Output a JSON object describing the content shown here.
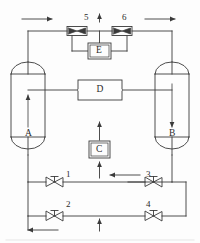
{
  "diagram": {
    "type": "process-flow-diagram",
    "line_color": "#3a3a3a",
    "background_color": "#fdfdfd",
    "equipment": [
      {
        "id": "A",
        "label": "A",
        "shape": "vertical-vessel",
        "flow_arrow": "up"
      },
      {
        "id": "B",
        "label": "B",
        "shape": "vertical-vessel",
        "flow_arrow": "down"
      },
      {
        "id": "C",
        "label": "C",
        "shape": "double-border-box",
        "flow_arrow": "up"
      },
      {
        "id": "D",
        "label": "D",
        "shape": "rectangle-box"
      },
      {
        "id": "E",
        "label": "E",
        "shape": "double-border-box"
      }
    ],
    "valves": [
      {
        "id": "1",
        "label": "1",
        "style": "gate-valve",
        "orientation": "horizontal"
      },
      {
        "id": "2",
        "label": "2",
        "style": "gate-valve",
        "orientation": "horizontal"
      },
      {
        "id": "3",
        "label": "3",
        "style": "gate-valve",
        "orientation": "horizontal"
      },
      {
        "id": "4",
        "label": "4",
        "style": "gate-valve",
        "orientation": "horizontal"
      },
      {
        "id": "5",
        "label": "5",
        "style": "inline-valve-box",
        "orientation": "horizontal"
      },
      {
        "id": "6",
        "label": "6",
        "style": "inline-valve-box",
        "orientation": "horizontal"
      }
    ],
    "flow_arrows": [
      {
        "name": "top-left-inlet",
        "direction": "right"
      },
      {
        "name": "top-right-outlet",
        "direction": "right"
      },
      {
        "name": "top-center-vent",
        "direction": "up"
      },
      {
        "name": "vessel-a-internal",
        "direction": "up"
      },
      {
        "name": "vessel-b-internal",
        "direction": "down"
      },
      {
        "name": "c-inlet",
        "direction": "up"
      },
      {
        "name": "c-outlet",
        "direction": "up"
      },
      {
        "name": "upper-valve-row",
        "direction": "left"
      },
      {
        "name": "bottom-center-feed",
        "direction": "up"
      },
      {
        "name": "bottom-left-outlet",
        "direction": "left"
      }
    ]
  },
  "labels": {
    "A": "A",
    "B": "B",
    "C": "C",
    "D": "D",
    "E": "E",
    "v1": "1",
    "v2": "2",
    "v3": "3",
    "v4": "4",
    "v5": "5",
    "v6": "6"
  }
}
